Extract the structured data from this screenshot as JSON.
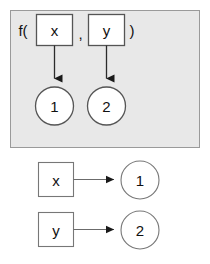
{
  "figure": {
    "type": "diagram",
    "kind": "variable-binding-diagram",
    "background_color": "#ffffff"
  },
  "panel": {
    "fill_color": "#e8e8e8",
    "border_color": "#9a9a9a",
    "call_prefix": "f(",
    "call_separator": ",",
    "call_suffix": ")",
    "params": [
      {
        "label": "x",
        "target": "1"
      },
      {
        "label": "y",
        "target": "2"
      }
    ],
    "values": [
      {
        "label": "1"
      },
      {
        "label": "2"
      }
    ]
  },
  "bindings": [
    {
      "source": "x",
      "target": "1"
    },
    {
      "source": "y",
      "target": "2"
    }
  ]
}
